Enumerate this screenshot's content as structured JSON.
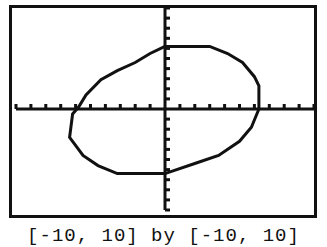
{
  "chart_data": {
    "type": "line",
    "title": "",
    "xlabel": "",
    "ylabel": "",
    "xlim": [
      -10,
      10
    ],
    "ylim": [
      -10,
      10
    ],
    "xscl": 1,
    "yscl": 1,
    "grid": false,
    "axes_visible": true,
    "series": [
      {
        "name": "tilted ellipse",
        "points": [
          [
            0,
            6.2
          ],
          [
            3,
            6.2
          ],
          [
            4.2,
            5.5
          ],
          [
            5.2,
            4.6
          ],
          [
            6,
            3.2
          ],
          [
            6.3,
            2.3
          ],
          [
            6.3,
            0
          ],
          [
            5.8,
            -1.8
          ],
          [
            5.0,
            -3.2
          ],
          [
            3.6,
            -4.6
          ],
          [
            2,
            -5.4
          ],
          [
            0,
            -6.4
          ],
          [
            -3.2,
            -6.4
          ],
          [
            -4.5,
            -5.6
          ],
          [
            -5.5,
            -4.6
          ],
          [
            -6.2,
            -3.2
          ],
          [
            -6.4,
            -2.8
          ],
          [
            -6.2,
            -0.5
          ],
          [
            -5.8,
            0.2
          ],
          [
            -5.3,
            1.4
          ],
          [
            -4.3,
            2.9
          ],
          [
            -3.2,
            3.8
          ],
          [
            -2,
            4.6
          ],
          [
            -1,
            5.5
          ],
          [
            0,
            6.2
          ]
        ]
      }
    ]
  },
  "caption": "[-10, 10] by [-10, 10]"
}
